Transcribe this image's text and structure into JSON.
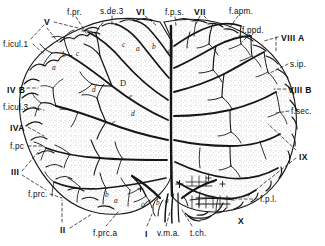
{
  "figure": {
    "background_color": "#ffffff",
    "ink_color": "#111111",
    "stipple_color": "#9a9a9a"
  },
  "labels": {
    "top": [
      {
        "id": "lobule-5",
        "text": "V",
        "kind": "roman",
        "x": 44,
        "y": 18
      },
      {
        "id": "f-pr",
        "text": "f.pr.",
        "kind": "term",
        "x": 67,
        "y": 9
      },
      {
        "id": "s-de-3",
        "text": "s.de.3",
        "kind": "term",
        "x": 100,
        "y": 8
      },
      {
        "id": "lobule-6",
        "text": "VI",
        "kind": "roman",
        "x": 136,
        "y": 8
      },
      {
        "id": "f-p-s",
        "text": "f.p.s.",
        "kind": "term",
        "x": 165,
        "y": 9
      },
      {
        "id": "lobule-7",
        "text": "VII",
        "kind": "roman",
        "x": 194,
        "y": 8
      },
      {
        "id": "f-apm",
        "text": "f.apm.",
        "kind": "term",
        "x": 229,
        "y": 8
      },
      {
        "id": "f-ppd",
        "text": "f.ppd.",
        "kind": "term",
        "x": 242,
        "y": 27
      }
    ],
    "left": [
      {
        "id": "f-icul-1",
        "text": "f.icul.1",
        "kind": "term",
        "x": 3,
        "y": 41
      },
      {
        "id": "lobule-4b",
        "text": "IV B",
        "kind": "roman",
        "x": 7,
        "y": 86
      },
      {
        "id": "f-icul-3",
        "text": "f.icul.3",
        "kind": "term",
        "x": 3,
        "y": 104
      },
      {
        "id": "lobule-4a",
        "text": "IVA",
        "kind": "roman",
        "x": 10,
        "y": 124
      },
      {
        "id": "f-pc",
        "text": "f.pc",
        "kind": "term",
        "x": 10,
        "y": 143
      },
      {
        "id": "lobule-3",
        "text": "III",
        "kind": "roman",
        "x": 11,
        "y": 168
      },
      {
        "id": "f-prc",
        "text": "f.prc.",
        "kind": "term",
        "x": 28,
        "y": 191
      },
      {
        "id": "lobule-2",
        "text": "II",
        "kind": "roman",
        "x": 60,
        "y": 226
      }
    ],
    "right": [
      {
        "id": "lobule-8a",
        "text": "VIII A",
        "kind": "roman",
        "x": 281,
        "y": 34
      },
      {
        "id": "s-ip",
        "text": "s.ip.",
        "kind": "term",
        "x": 290,
        "y": 61
      },
      {
        "id": "lobule-8b",
        "text": "VIII B",
        "kind": "roman",
        "x": 288,
        "y": 86
      },
      {
        "id": "f-sec",
        "text": "f.sec.",
        "kind": "term",
        "x": 291,
        "y": 108
      },
      {
        "id": "lobule-9",
        "text": "IX",
        "kind": "roman",
        "x": 299,
        "y": 153
      },
      {
        "id": "f-p-l",
        "text": "f.p.l.",
        "kind": "term",
        "x": 260,
        "y": 196
      },
      {
        "id": "lobule-10",
        "text": "X",
        "kind": "roman",
        "x": 238,
        "y": 217
      }
    ],
    "bottom": [
      {
        "id": "f-prc-a",
        "text": "f.prc.a",
        "kind": "term",
        "x": 93,
        "y": 230
      },
      {
        "id": "lobule-1",
        "text": "I",
        "kind": "roman",
        "x": 145,
        "y": 230
      },
      {
        "id": "v-m-a",
        "text": "v.m.a.",
        "kind": "term",
        "x": 157,
        "y": 230
      },
      {
        "id": "t-ch",
        "text": "t.ch.",
        "kind": "term",
        "x": 190,
        "y": 230
      }
    ]
  },
  "inner_letters": [
    {
      "text": "a",
      "x": 52,
      "y": 63,
      "style": "lower"
    },
    {
      "text": "b",
      "x": 62,
      "y": 50,
      "style": "lower"
    },
    {
      "text": "c",
      "x": 76,
      "y": 49,
      "style": "lower"
    },
    {
      "text": "d",
      "x": 92,
      "y": 85,
      "style": "lower"
    },
    {
      "text": "e",
      "x": 112,
      "y": 118,
      "style": "lower"
    },
    {
      "text": "D",
      "x": 120,
      "y": 79,
      "style": "cap"
    },
    {
      "text": "e",
      "x": 129,
      "y": 92,
      "style": "lower"
    },
    {
      "text": "d",
      "x": 131,
      "y": 109,
      "style": "lower"
    },
    {
      "text": "c",
      "x": 122,
      "y": 40,
      "style": "lower"
    },
    {
      "text": "a",
      "x": 136,
      "y": 44,
      "style": "lower"
    },
    {
      "text": "b",
      "x": 152,
      "y": 42,
      "style": "lower"
    },
    {
      "text": "c",
      "x": 168,
      "y": 46,
      "style": "lower"
    },
    {
      "text": "b",
      "x": 105,
      "y": 190,
      "style": "lower"
    },
    {
      "text": "a",
      "x": 114,
      "y": 196,
      "style": "lower"
    },
    {
      "text": "c",
      "x": 141,
      "y": 200,
      "style": "lower"
    },
    {
      "text": "b",
      "x": 156,
      "y": 198,
      "style": "lower"
    },
    {
      "text": "a",
      "x": 165,
      "y": 196,
      "style": "lower"
    }
  ],
  "legend_note": {
    "markers": "Roman numerals I-X denote cerebellar lobules; lower-case letters denote folia subdivisions; f. / s. prefixes denote fissures and sulci."
  }
}
